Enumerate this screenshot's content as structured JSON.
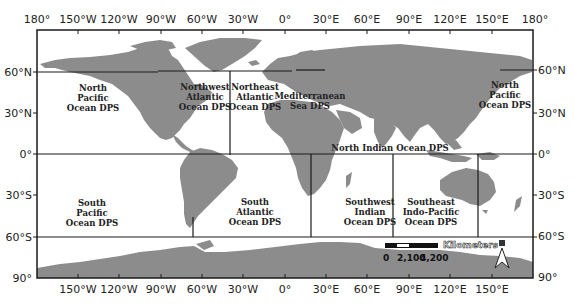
{
  "map": {
    "frame": {
      "left": 37,
      "top": 30,
      "right": 533,
      "bottom": 278
    },
    "colors": {
      "land": "#8c8c8c",
      "ocean": "#ffffff",
      "line": "#1a1a1a",
      "text": "#222222"
    },
    "longitude_ticks_top": [
      "180°",
      "150°W",
      "120°W",
      "90°W",
      "60°W",
      "30°W",
      "0°",
      "30°E",
      "60°E",
      "90°E",
      "120°E",
      "150°E",
      "180°"
    ],
    "longitude_ticks_bottom": [
      "150°W",
      "120°W",
      "90°W",
      "60°W",
      "30°W",
      "0°",
      "30°E",
      "60°E",
      "90°E",
      "120°E",
      "150°E"
    ],
    "latitude_ticks_left": [
      "60°N",
      "30°N",
      "0°",
      "30°S",
      "60°S",
      "90°"
    ],
    "latitude_ticks_right": [
      "180°",
      "60°N",
      "30°N",
      "0°",
      "30°S",
      "60°S",
      "90°"
    ]
  },
  "ticks": {
    "top": {
      "t0": "180°",
      "t1": "150°W",
      "t2": "120°W",
      "t3": "90°W",
      "t4": "60°W",
      "t5": "30°W",
      "t6": "0°",
      "t7": "30°E",
      "t8": "60°E",
      "t9": "90°E",
      "t10": "120°E",
      "t11": "150°E",
      "t12": "180°"
    },
    "bottom": {
      "t1": "150°W",
      "t2": "120°W",
      "t3": "90°W",
      "t4": "60°W",
      "t5": "30°W",
      "t6": "0°",
      "t7": "30°E",
      "t8": "60°E",
      "t9": "90°E",
      "t10": "120°E",
      "t11": "150°E"
    },
    "left": {
      "n60": "60°N",
      "n30": "30°N",
      "eq": "0°",
      "s30": "30°S",
      "s60": "60°S",
      "s90": "90°"
    },
    "right": {
      "n60": "60°N",
      "n30": "30°N",
      "eq": "0°",
      "s30": "30°S",
      "s60": "60°S",
      "s90": "90°"
    }
  },
  "regions": {
    "north_pacific_west": {
      "line1": "North",
      "line2": "Pacific",
      "line3": "Ocean DPS"
    },
    "northwest_atlantic": {
      "line1": "Northwest",
      "line2": "Atlantic",
      "line3": "Ocean DPS"
    },
    "northeast_atlantic": {
      "line1": "Northeast",
      "line2": "Atlantic",
      "line3": "Ocean DPS"
    },
    "mediterranean": {
      "line1": "Mediterranean",
      "line2": "Sea DPS"
    },
    "north_pacific_east": {
      "line1": "North",
      "line2": "Pacific",
      "line3": "Ocean DPS"
    },
    "north_indian": {
      "line1": "North Indian Ocean DPS"
    },
    "south_pacific": {
      "line1": "South",
      "line2": "Pacific",
      "line3": "Ocean DPS"
    },
    "south_atlantic": {
      "line1": "South",
      "line2": "Atlantic",
      "line3": "Ocean DPS"
    },
    "southwest_indian": {
      "line1": "Southwest",
      "line2": "Indian",
      "line3": "Ocean DPS"
    },
    "southeast_indo_pacific": {
      "line1": "Southeast",
      "line2": "Indo-Pacific",
      "line3": "Ocean DPS"
    }
  },
  "scale_bar": {
    "title": "Kilometers",
    "labels": {
      "l0": "0",
      "l1": "2,100",
      "l2": "4,200"
    }
  },
  "north_arrow": {
    "label": "N"
  }
}
